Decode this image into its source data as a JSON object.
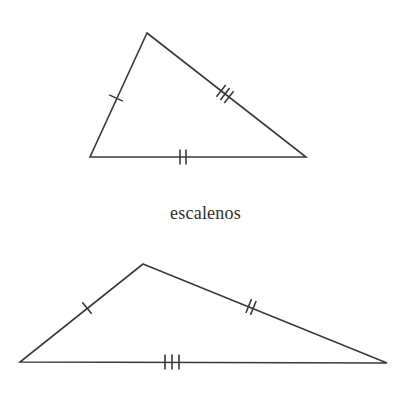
{
  "figure": {
    "title": "escalenos",
    "background_color": "#ffffff",
    "stroke_color": "#3a3a3a",
    "tick_color": "#3a3a3a",
    "stroke_width": 1.6,
    "tick_width": 1.6,
    "caption": {
      "text": "escalenos",
      "color": "#2e2e2e",
      "font_size_px": 18,
      "x": 236,
      "y": 218
    },
    "shapes": [
      {
        "name": "triangle-upper",
        "type": "triangle",
        "classification": "escaleno",
        "vertices": [
          {
            "label": "apex",
            "x": 147,
            "y": 33
          },
          {
            "label": "bottom-right",
            "x": 306,
            "y": 157
          },
          {
            "label": "bottom-left",
            "x": 90,
            "y": 157
          }
        ],
        "sides": [
          {
            "name": "side-left",
            "from": {
              "x": 90,
              "y": 157
            },
            "to": {
              "x": 147,
              "y": 33
            },
            "tick_count": 1,
            "tick_center": {
              "x": 116,
              "y": 98
            },
            "tick_length": 15,
            "tick_spacing": 5
          },
          {
            "name": "side-right",
            "from": {
              "x": 147,
              "y": 33
            },
            "to": {
              "x": 306,
              "y": 157
            },
            "tick_count": 3,
            "tick_center": {
              "x": 225,
              "y": 94
            },
            "tick_length": 15,
            "tick_spacing": 5
          },
          {
            "name": "side-bottom",
            "from": {
              "x": 90,
              "y": 157
            },
            "to": {
              "x": 306,
              "y": 157
            },
            "tick_count": 2,
            "tick_center": {
              "x": 183,
              "y": 157
            },
            "tick_length": 15,
            "tick_spacing": 6
          }
        ]
      },
      {
        "name": "triangle-lower",
        "type": "triangle",
        "classification": "escaleno",
        "vertices": [
          {
            "label": "apex",
            "x": 143,
            "y": 264
          },
          {
            "label": "bottom-right",
            "x": 387,
            "y": 363
          },
          {
            "label": "bottom-left",
            "x": 20,
            "y": 362
          }
        ],
        "sides": [
          {
            "name": "side-left",
            "from": {
              "x": 20,
              "y": 362
            },
            "to": {
              "x": 143,
              "y": 264
            },
            "tick_count": 1,
            "tick_center": {
              "x": 87,
              "y": 308
            },
            "tick_length": 15,
            "tick_spacing": 5
          },
          {
            "name": "side-right",
            "from": {
              "x": 143,
              "y": 264
            },
            "to": {
              "x": 387,
              "y": 363
            },
            "tick_count": 2,
            "tick_center": {
              "x": 251,
              "y": 307
            },
            "tick_length": 15,
            "tick_spacing": 5
          },
          {
            "name": "side-bottom",
            "from": {
              "x": 20,
              "y": 362
            },
            "to": {
              "x": 387,
              "y": 363
            },
            "tick_count": 3,
            "tick_center": {
              "x": 172,
              "y": 362
            },
            "tick_length": 15,
            "tick_spacing": 7
          }
        ]
      }
    ]
  }
}
